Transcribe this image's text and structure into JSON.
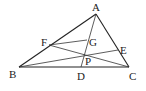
{
  "diagram": {
    "type": "geometry-triangle",
    "points": {
      "A": {
        "label": "A",
        "x": 96,
        "y": 14,
        "lx": 92,
        "ly": 11
      },
      "B": {
        "label": "B",
        "x": 19,
        "y": 67,
        "lx": 9,
        "ly": 78
      },
      "C": {
        "label": "C",
        "x": 129,
        "y": 67,
        "lx": 129,
        "ly": 80
      },
      "D": {
        "label": "D",
        "x": 81,
        "y": 67,
        "lx": 77,
        "ly": 80
      },
      "E": {
        "label": "E",
        "x": 118,
        "y": 50,
        "lx": 120,
        "ly": 54
      },
      "F": {
        "label": "F",
        "x": 49,
        "y": 45,
        "lx": 41,
        "ly": 46
      },
      "G": {
        "label": "G",
        "x": 87,
        "y": 40,
        "lx": 89,
        "ly": 46
      },
      "P": {
        "label": "P",
        "x": 84,
        "y": 55,
        "lx": 85,
        "ly": 65
      }
    },
    "segments": [
      [
        "A",
        "B"
      ],
      [
        "A",
        "C"
      ],
      [
        "B",
        "C"
      ],
      [
        "A",
        "D"
      ],
      [
        "B",
        "E"
      ],
      [
        "C",
        "F"
      ],
      [
        "F",
        "G"
      ]
    ]
  }
}
